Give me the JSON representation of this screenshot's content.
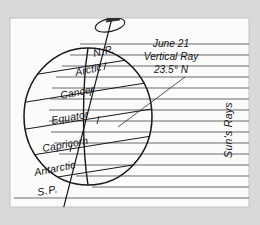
{
  "figure": {
    "background_color": "#d9d9d9",
    "panel_color": "#fbfbfa",
    "ink_color": "#15161a",
    "night_color": "#6f6f70",
    "day_color": "#ffffff"
  },
  "globe": {
    "labels": {
      "north_pole": "N.P.",
      "arctic": "Arctic",
      "cancer": "Cancer",
      "equator": "Equator",
      "capricorn": "Capricorn",
      "antarctic": "Antarctic",
      "south_pole": "S.P."
    }
  },
  "annotation": {
    "line1": "June 21",
    "line2": "Vertical Ray",
    "line3": "23.5° N"
  },
  "rays": {
    "label": "Sun's Rays",
    "count": 15
  },
  "axis": {
    "rotation_label": "rotation-arrow"
  }
}
